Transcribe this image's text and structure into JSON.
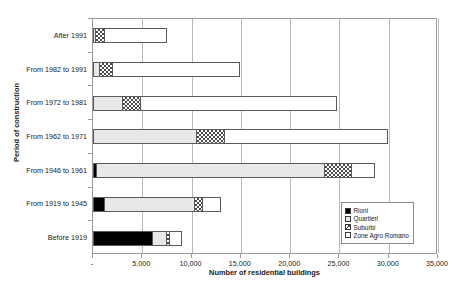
{
  "chart_data": {
    "type": "bar",
    "orientation": "horizontal",
    "stacked": true,
    "title": "",
    "xlabel": "Number of residential buildings",
    "ylabel": "Period of construction",
    "xlim": [
      0,
      35000
    ],
    "xticks": [
      "-",
      "5,000",
      "10,000",
      "15,000",
      "20,000",
      "25,000",
      "30,000",
      "35,000"
    ],
    "xtick_values": [
      0,
      5000,
      10000,
      15000,
      20000,
      25000,
      30000,
      35000
    ],
    "grid": "vertical",
    "legend_position": "inside-bottom-right",
    "categories": [
      "After 1991",
      "From 1982 to 1991",
      "From 1972 to 1981",
      "From 1962 to 1971",
      "From 1946 to 1961",
      "From 1919 to 1945",
      "Before 1919"
    ],
    "series": [
      {
        "name": "Rioni",
        "fill": "rioni",
        "values": [
          0,
          0,
          0,
          0,
          300,
          1100,
          6100
        ]
      },
      {
        "name": "Quartieri",
        "fill": "quartieri",
        "values": [
          200,
          600,
          3000,
          10500,
          23300,
          9300,
          1500
        ]
      },
      {
        "name": "Suburbi",
        "fill": "suburbi",
        "values": [
          900,
          1400,
          1800,
          2900,
          2800,
          800,
          300
        ]
      },
      {
        "name": "Zone Agro Romano",
        "fill": "zone",
        "values": [
          6400,
          12900,
          20000,
          16500,
          2200,
          1800,
          1100
        ]
      }
    ],
    "totals": [
      7500,
      14900,
      24800,
      29900,
      28600,
      13000,
      9000
    ]
  },
  "legend": {
    "items": [
      {
        "label": "Rioni",
        "fill": "rioni"
      },
      {
        "label": "Quartieri",
        "fill": "quartieri"
      },
      {
        "label": "Suburbi",
        "fill": "suburbi"
      },
      {
        "label": "Zone Agro Romano",
        "fill": "zone"
      }
    ]
  }
}
